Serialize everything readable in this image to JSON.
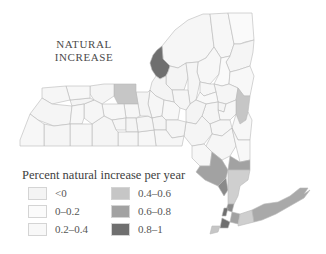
{
  "map": {
    "title_lines": [
      "NATURAL",
      "INCREASE"
    ],
    "region": "New York State counties"
  },
  "legend": {
    "title": "Percent natural increase per year",
    "items": [
      {
        "label": "<0",
        "color": "#f4f4f4"
      },
      {
        "label": "0–0.2",
        "color": "#fbfbfb"
      },
      {
        "label": "0.2–0.4",
        "color": "#f8f8f8"
      },
      {
        "label": "0.4–0.6",
        "color": "#c6c6c6"
      },
      {
        "label": "0.6–0.8",
        "color": "#a2a2a2"
      },
      {
        "label": "0.8–1",
        "color": "#6f6f6f"
      }
    ]
  }
}
